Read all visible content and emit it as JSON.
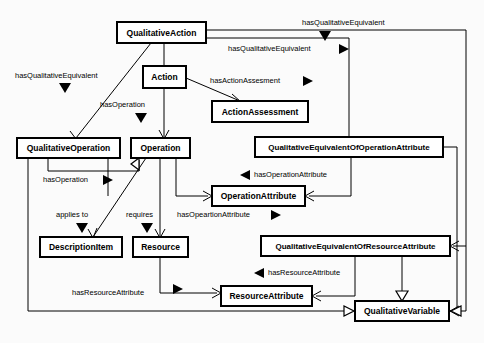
{
  "diagram": {
    "kind": "uml-class-diagram",
    "title": "",
    "canvas": {
      "width": 484,
      "height": 343,
      "background": "#fbfbfb"
    },
    "style": {
      "box_fill": "#ffffff",
      "box_stroke": "#000000",
      "edge_stroke": "#000000"
    },
    "classes": [
      {
        "id": "qualitativeAction",
        "label": "QualitativeAction",
        "x": 117,
        "y": 22,
        "w": 89,
        "h": 21,
        "font_size": 8.5
      },
      {
        "id": "action",
        "label": "Action",
        "x": 143,
        "y": 66,
        "w": 43,
        "h": 22,
        "font_size": 8.5
      },
      {
        "id": "actionAssessment",
        "label": "ActionAssessment",
        "x": 212,
        "y": 101,
        "w": 96,
        "h": 21,
        "font_size": 8.5
      },
      {
        "id": "qualitativeOperation",
        "label": "QualitativeOperation",
        "x": 17,
        "y": 138,
        "w": 103,
        "h": 20,
        "font_size": 8.5
      },
      {
        "id": "operation",
        "label": "Operation",
        "x": 131,
        "y": 138,
        "w": 59,
        "h": 20,
        "font_size": 8.5
      },
      {
        "id": "qeOperationAttr",
        "label": "QualitativeEquivalentOfOperationAttribute",
        "x": 255,
        "y": 137,
        "w": 188,
        "h": 20,
        "font_size": 8.0
      },
      {
        "id": "operationAttribute",
        "label": "OperationAttribute",
        "x": 212,
        "y": 186,
        "w": 93,
        "h": 20,
        "font_size": 8.5
      },
      {
        "id": "descriptionItem",
        "label": "DescriptionItem",
        "x": 40,
        "y": 237,
        "w": 82,
        "h": 20,
        "font_size": 8.5
      },
      {
        "id": "resource",
        "label": "Resource",
        "x": 133,
        "y": 237,
        "w": 55,
        "h": 20,
        "font_size": 8.5
      },
      {
        "id": "qeResourceAttr",
        "label": "QualitativeEquivalentOfResourceAttribute",
        "x": 261,
        "y": 236,
        "w": 189,
        "h": 20,
        "font_size": 8.0
      },
      {
        "id": "resourceAttribute",
        "label": "ResourceAttribute",
        "x": 221,
        "y": 286,
        "w": 91,
        "h": 20,
        "font_size": 8.5
      },
      {
        "id": "qualitativeVariable",
        "label": "QualitativeVariable",
        "x": 355,
        "y": 301,
        "w": 94,
        "h": 20,
        "font_size": 8.5
      }
    ],
    "relations": [
      {
        "id": "rel-qa-qv-top",
        "label": "hasQualitativeEquivalent",
        "label_x": 302,
        "label_y": 23,
        "marker": "down-solid",
        "marker_x": 325,
        "marker_y": 36,
        "from": "qualitativeAction",
        "to": "qualitativeVariable"
      },
      {
        "id": "rel-qa-qeop",
        "label": "hasQualitativeEquivalent",
        "label_x": 228,
        "label_y": 49,
        "marker": "right-solid",
        "marker_x": 343,
        "marker_y": 49,
        "from": "qualitativeAction",
        "to": "qeOperationAttr"
      },
      {
        "id": "rel-qa-qop",
        "label": "hasQualitativeEquivalent",
        "label_x": 15,
        "label_y": 76,
        "marker": "down-solid",
        "marker_x": 65,
        "marker_y": 88,
        "from": "qualitativeAction",
        "to": "qualitativeOperation"
      },
      {
        "id": "rel-action-assess",
        "label": "hasActionAssesment",
        "label_x": 210,
        "label_y": 81,
        "marker": "right-solid",
        "marker_x": 307,
        "marker_y": 81,
        "from": "action",
        "to": "actionAssessment"
      },
      {
        "id": "rel-action-op",
        "label": "hasOperation",
        "label_x": 100,
        "label_y": 105,
        "marker": "down-solid",
        "marker_x": 141,
        "marker_y": 118,
        "from": "action",
        "to": "operation"
      },
      {
        "id": "rel-qop-op",
        "label": "hasOperation",
        "label_x": 43,
        "label_y": 180,
        "marker": "right-solid",
        "marker_x": 107,
        "marker_y": 180,
        "from": "qualitativeOperation",
        "to": "operation"
      },
      {
        "id": "rel-qeop-opattr",
        "label": "hasOperationAttribute",
        "label_x": 254,
        "label_y": 175,
        "marker": "left-solid",
        "marker_x": 244,
        "marker_y": 175,
        "from": "qeOperationAttr",
        "to": "operationAttribute"
      },
      {
        "id": "rel-op-descitem",
        "label": "applies to",
        "label_x": 56,
        "label_y": 215,
        "marker": "down-solid",
        "marker_x": 82,
        "marker_y": 228,
        "from": "operation",
        "to": "descriptionItem"
      },
      {
        "id": "rel-op-resource",
        "label": "requires",
        "label_x": 126,
        "label_y": 215,
        "marker": "down-solid",
        "marker_x": 147,
        "marker_y": 228,
        "from": "operation",
        "to": "resource"
      },
      {
        "id": "rel-op-opattr",
        "label": "hasOpeartionAttribute",
        "label_x": 177,
        "label_y": 215,
        "marker": "right-solid",
        "marker_x": 275,
        "marker_y": 215,
        "from": "operation",
        "to": "operationAttribute"
      },
      {
        "id": "rel-qeres-resattr",
        "label": "hasResourceAttribute",
        "label_x": 268,
        "label_y": 273,
        "marker": "left-solid",
        "marker_x": 258,
        "marker_y": 273,
        "from": "qeResourceAttr",
        "to": "resourceAttribute"
      },
      {
        "id": "rel-res-resattr",
        "label": "hasResourceAttribute",
        "label_x": 72,
        "label_y": 293,
        "marker": "right-solid",
        "marker_x": 177,
        "marker_y": 290,
        "from": "resource",
        "to": "resourceAttribute"
      }
    ],
    "generalizations": [
      {
        "id": "gen-action-qa",
        "from": "action",
        "to": "qualitativeAction",
        "marker": "hollow-up"
      },
      {
        "id": "gen-qv-qeres",
        "from": "qualitativeVariable",
        "to": "qeResourceAttr",
        "marker": "hollow-up"
      },
      {
        "id": "gen-op-qop",
        "from": "operation",
        "to": "qualitativeOperation",
        "marker": "hollow-left"
      },
      {
        "id": "gen-qv-left",
        "from": "qualitativeVariable",
        "to": "qualitativeOperation",
        "marker": "hollow-left"
      },
      {
        "id": "gen-qv-right",
        "from": "qualitativeVariable",
        "to": "qeOperationAttr",
        "marker": "hollow-right"
      }
    ]
  }
}
